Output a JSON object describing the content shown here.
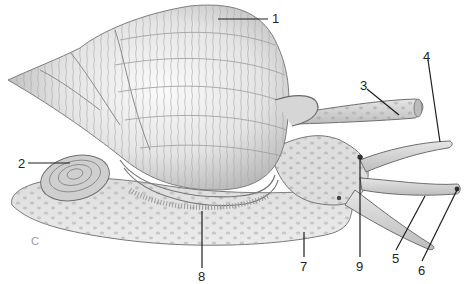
{
  "diagram": {
    "panel_letter": "C",
    "palette": {
      "background": "#ffffff",
      "shell_light": "#f1f1f1",
      "shell_mid": "#cfcfcf",
      "shell_line": "#8f8f8f",
      "body_light": "#e2e2e2",
      "body_spot": "#a9a9a9",
      "outline": "#6e6e6e",
      "leader": "#1e1e1e"
    },
    "labels": [
      {
        "id": "1",
        "text": "1",
        "x": 272,
        "y": 12,
        "line": [
          [
            218,
            19
          ],
          [
            268,
            19
          ]
        ]
      },
      {
        "id": "2",
        "text": "2",
        "x": 18,
        "y": 157,
        "line": [
          [
            28,
            163
          ],
          [
            70,
            163
          ]
        ]
      },
      {
        "id": "3",
        "text": "3",
        "x": 360,
        "y": 79,
        "line": [
          [
            367,
            89
          ],
          [
            399,
            115
          ]
        ]
      },
      {
        "id": "4",
        "text": "4",
        "x": 423,
        "y": 50,
        "line": [
          [
            428,
            60
          ],
          [
            440,
            142
          ]
        ]
      },
      {
        "id": "5",
        "text": "5",
        "x": 392,
        "y": 254,
        "line": [
          [
            396,
            250
          ],
          [
            425,
            196
          ]
        ]
      },
      {
        "id": "6",
        "text": "6",
        "x": 418,
        "y": 266,
        "line": [
          [
            422,
            261
          ],
          [
            458,
            188
          ]
        ]
      },
      {
        "id": "7",
        "text": "7",
        "x": 301,
        "y": 262,
        "line": [
          [
            304,
            257
          ],
          [
            304,
            232
          ]
        ]
      },
      {
        "id": "8",
        "text": "8",
        "x": 198,
        "y": 272,
        "line": [
          [
            202,
            268
          ],
          [
            202,
            211
          ]
        ]
      },
      {
        "id": "9",
        "text": "9",
        "x": 356,
        "y": 262,
        "line": [
          [
            360,
            257
          ],
          [
            360,
            158
          ]
        ]
      }
    ]
  }
}
